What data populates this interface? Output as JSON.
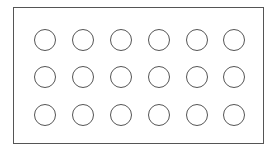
{
  "diagram": {
    "shape": "rectangle-with-circle-grid",
    "rows": 3,
    "columns": 6,
    "stroke_color": "#555555",
    "fill_color": "#ffffff",
    "circle_centers_x": [
      45,
      83,
      121,
      159,
      197,
      234
    ],
    "circle_centers_y": [
      40,
      77,
      115
    ],
    "circle_diameter": 22
  }
}
